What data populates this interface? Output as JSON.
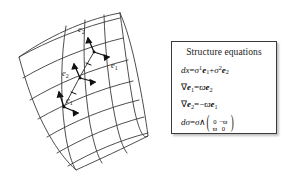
{
  "figure": {
    "background_color": "#ffffff",
    "ink_color": "#3a3a3a"
  },
  "diagram": {
    "name": "curved-surface-patch",
    "frame_labels": [
      {
        "id": "e2-upper",
        "base": "e",
        "subscript": "2",
        "x": 82,
        "y": 34
      },
      {
        "id": "e1-upper",
        "base": "e",
        "subscript": "1",
        "x": 115,
        "y": 64
      },
      {
        "id": "e2-lower",
        "base": "e",
        "subscript": "2",
        "x": 68,
        "y": 73
      },
      {
        "id": "e1-lower",
        "base": "e",
        "subscript": "1",
        "x": 73,
        "y": 98
      }
    ]
  },
  "equations_panel": {
    "title": "Structure equations",
    "border_color": "#3a3a3a",
    "equations": [
      {
        "id": "dx",
        "plain": "dx = σ¹e₁ + σ²e₂"
      },
      {
        "id": "nabla-e1",
        "plain": "∇e₁ = ϖe₂"
      },
      {
        "id": "nabla-e2",
        "plain": "∇e₂ = −ϖe₁"
      },
      {
        "id": "dsigma",
        "plain": "dσ = σ ∧ ( 0 −ϖ ; ϖ 0 )",
        "matrix": [
          [
            "0",
            "−ϖ"
          ],
          [
            "ϖ",
            "0"
          ]
        ]
      }
    ],
    "symbols": {
      "d": "d",
      "x": "x",
      "sigma": "σ",
      "varpi": "ϖ",
      "nabla": "∇",
      "wedge": "∧",
      "equals": "=",
      "plus": "+",
      "minus": "−",
      "e": "e",
      "one": "1",
      "two": "2",
      "zero": "0"
    }
  }
}
